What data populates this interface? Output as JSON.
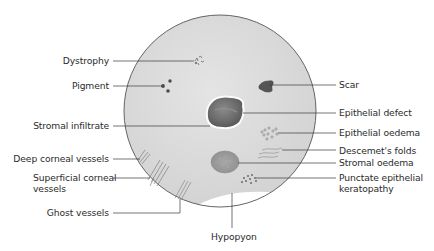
{
  "diagram": {
    "type": "cornea-annotation",
    "colors": {
      "cornea_fill": "#d9d9d9",
      "cornea_edge": "#555555",
      "lesion_dark": "#6b6b6b",
      "leader_line": "#3a3a3a",
      "text": "#2b2b2b"
    },
    "labels_left": [
      {
        "id": "dystrophy",
        "text": "Dystrophy"
      },
      {
        "id": "pigment",
        "text": "Pigment"
      },
      {
        "id": "stromal-infiltrate",
        "text": "Stromal infiltrate"
      },
      {
        "id": "deep-corneal-vessels",
        "text": "Deep corneal vessels"
      },
      {
        "id": "superficial-corneal-vessels",
        "text": "Superficial corneal",
        "text2": "vessels"
      },
      {
        "id": "ghost-vessels",
        "text": "Ghost vessels"
      }
    ],
    "labels_right": [
      {
        "id": "scar",
        "text": "Scar"
      },
      {
        "id": "epithelial-defect",
        "text": "Epithelial defect"
      },
      {
        "id": "epithelial-oedema",
        "text": "Epithelial oedema"
      },
      {
        "id": "descemets-folds",
        "text": "Descemet's folds"
      },
      {
        "id": "stromal-oedema",
        "text": "Stromal oedema"
      },
      {
        "id": "punctate-epithelial-keratopathy",
        "text": "Punctate epithelial",
        "text2": "keratopathy"
      }
    ],
    "labels_bottom": [
      {
        "id": "hypopyon",
        "text": "Hypopyon"
      }
    ]
  }
}
